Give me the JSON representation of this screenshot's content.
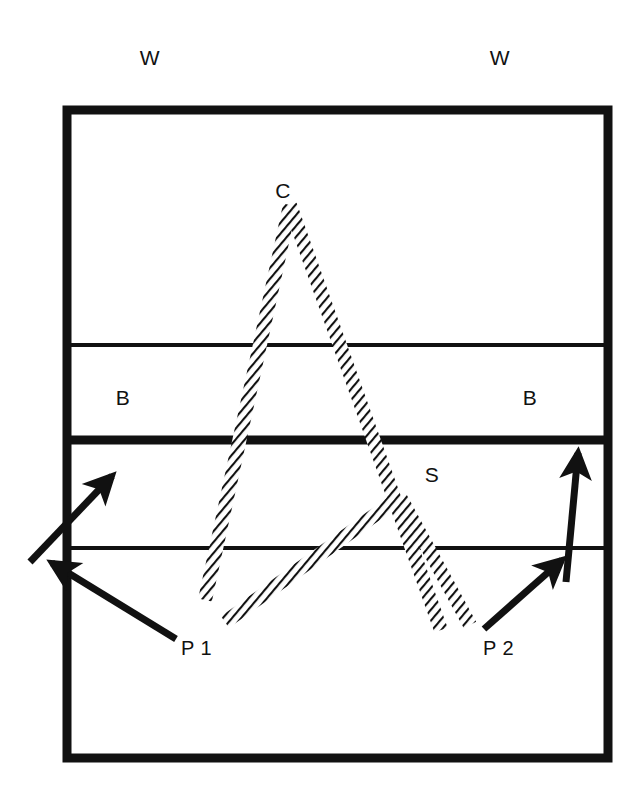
{
  "figure": {
    "kind": "geological-cross-section",
    "background_color": "#ffffff",
    "ink_color": "#111111",
    "frame": {
      "x": 67,
      "y": 110,
      "width": 541,
      "height": 648,
      "stroke_width": 9,
      "name": "block-diagram-frame"
    },
    "labels": {
      "w_left": "W",
      "w_right": "W",
      "b_left": "B",
      "b_right": "B",
      "c_peak": "C",
      "s_trough": "S",
      "p1": "P 1",
      "p2": "P 2"
    },
    "label_positions": {
      "w_left": {
        "x": 150,
        "y": 65
      },
      "w_right": {
        "x": 500,
        "y": 65
      },
      "b_left": {
        "x": 123,
        "y": 405
      },
      "b_right": {
        "x": 530,
        "y": 405
      },
      "c_peak": {
        "x": 283,
        "y": 198
      },
      "s_trough": {
        "x": 432,
        "y": 482
      },
      "p1": {
        "x": 181,
        "y": 655
      },
      "p2": {
        "x": 483,
        "y": 655
      }
    },
    "bedding_planes": [
      {
        "name": "bedding-plane-upper-thin",
        "y": 345,
        "stroke_width": 4
      },
      {
        "name": "bedding-plane-middle-thick",
        "y": 440,
        "stroke_width": 9
      },
      {
        "name": "bedding-plane-lower-thin",
        "y": 548,
        "stroke_width": 4
      }
    ],
    "folds": {
      "anticline": {
        "label": "C",
        "apex": {
          "x": 290,
          "y": 205
        },
        "left_limb_end": {
          "x": 205,
          "y": 600
        },
        "right_limb_end": {
          "x": 440,
          "y": 628
        },
        "band_width": 13
      },
      "syncline": {
        "label": "S",
        "trough": {
          "x": 400,
          "y": 498
        },
        "left_limb_end": {
          "x": 228,
          "y": 620
        },
        "right_limb_end": {
          "x": 470,
          "y": 622
        },
        "band_width": 13
      }
    },
    "arrows": [
      {
        "name": "arrow-left-upper",
        "from": {
          "x": 30,
          "y": 560
        },
        "to": {
          "x": 110,
          "y": 478
        },
        "stroke_width": 7
      },
      {
        "name": "arrow-left-lower",
        "from": {
          "x": 175,
          "y": 638
        },
        "to": {
          "x": 55,
          "y": 565
        },
        "stroke_width": 7
      },
      {
        "name": "arrow-right-vertical",
        "from": {
          "x": 566,
          "y": 580
        },
        "to": {
          "x": 578,
          "y": 455
        },
        "stroke_width": 7
      },
      {
        "name": "arrow-right-lower",
        "from": {
          "x": 486,
          "y": 627
        },
        "to": {
          "x": 560,
          "y": 562
        },
        "stroke_width": 7
      }
    ]
  }
}
